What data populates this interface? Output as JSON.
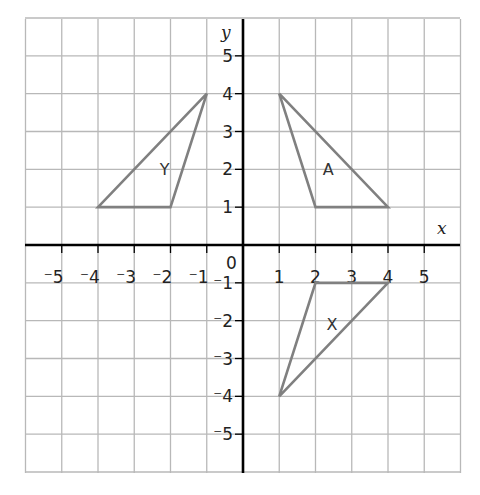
{
  "figure": {
    "axes": {
      "x_label": "x",
      "y_label": "y",
      "origin_label": "0",
      "x_ticks": [
        "⁻5",
        "⁻4",
        "⁻3",
        "⁻2",
        "⁻1",
        "1",
        "2",
        "3",
        "4",
        "5"
      ],
      "y_ticks": [
        "5",
        "4",
        "3",
        "2",
        "1",
        "⁻1",
        "⁻2",
        "⁻3",
        "⁻4",
        "⁻5"
      ],
      "x_range": [
        -6,
        6
      ],
      "y_range": [
        -6,
        6
      ]
    },
    "shapes": [
      {
        "label": "A",
        "vertices": [
          [
            1,
            4
          ],
          [
            2,
            1
          ],
          [
            4,
            1
          ]
        ]
      },
      {
        "label": "Y",
        "vertices": [
          [
            -1,
            4
          ],
          [
            -2,
            1
          ],
          [
            -4,
            1
          ]
        ]
      },
      {
        "label": "X",
        "vertices": [
          [
            2,
            -1
          ],
          [
            4,
            -1
          ],
          [
            1,
            -4
          ]
        ]
      }
    ],
    "colors": {
      "grid": "#b8b8b8",
      "axis": "#000000",
      "shape": "#808080"
    }
  }
}
